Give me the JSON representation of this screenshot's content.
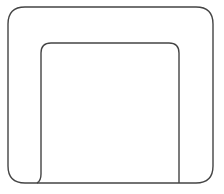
{
  "figure": {
    "stroke_color": "#444444",
    "background": "#ffffff",
    "shapes": {
      "outer_frame": {
        "x": 8,
        "y": 7,
        "width": 205,
        "height": 176,
        "radius": 17
      },
      "inner_seat": {
        "left": 41,
        "top": 43,
        "right": 179,
        "bottom": 183,
        "radius": 10
      }
    }
  }
}
